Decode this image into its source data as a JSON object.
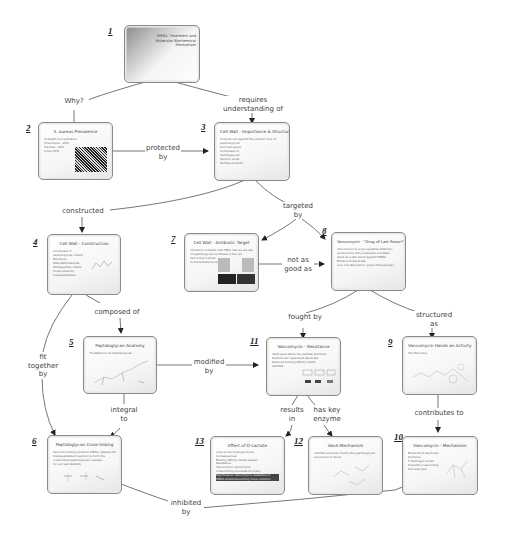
{
  "diagram": {
    "type": "concept-map",
    "nodes": [
      {
        "id": 1,
        "num": "1",
        "title": "MRSA: Treatment and Molecular Biochemical Mechanism",
        "body": [
          "",
          ""
        ]
      },
      {
        "id": 2,
        "num": "2",
        "title": "S. aureus Prevalence",
        "body": [
          "% Death Concentration of Population",
          "Pneumonia - 20%",
          "Trachea - 40%",
          "Colon 25%"
        ]
      },
      {
        "id": 3,
        "num": "3",
        "title": "Cell Wall - Importance & Structure",
        "body": [
          "Protects cell against the osmotic flow of",
          "peptidoglycan",
          "Cell wall layers",
          "Composed of:",
          "Peptidoglycan",
          "Teichoic acids",
          "Surface proteins"
        ]
      },
      {
        "id": 4,
        "num": "4",
        "title": "Cell Wall - Construction",
        "body": [
          "Composed of",
          "peptidoglycan chains",
          "Backbone",
          "NAG-NAM subunits",
          "Pentapeptide chains",
          "Cross-linked by",
          "transpeptidases"
        ]
      },
      {
        "id": 5,
        "num": "5",
        "title": "Peptidoglycan Anatomy",
        "body": [
          "The Basis for all Peptidoglycan"
        ]
      },
      {
        "id": 6,
        "num": "6",
        "title": "Peptidoglycan Cross-linking",
        "body": [
          "Penicillin binding proteins (PBPs) catalyze the",
          "transpeptidation reaction to form the",
          "cross-linked peptidoglycan needed",
          "for cell wall stability"
        ]
      },
      {
        "id": 7,
        "num": "7",
        "title": "Cell Wall - Antibiotic Target",
        "body": [
          "Inhibitors compete with PBPs, but we are aware",
          "of peptidoglycan synthesis in the cell",
          "Vancomycin binds",
          "to D-Ala-D-Ala termini"
        ]
      },
      {
        "id": 8,
        "num": "8",
        "title": "Vancomycin - \"Drug of Last Resort\"",
        "body": [
          "Vancomycin is a glycopeptide antibiotic",
          "produced by Amycolatopsis orientalis",
          "Used as a last resort against MRSA",
          "Binds to D-Ala-D-Ala",
          "Low oral absorption; given intravenously"
        ]
      },
      {
        "id": 9,
        "num": "9",
        "title": "Vancomycin Hands an Activity",
        "body": [
          "The Structure"
        ]
      },
      {
        "id": 10,
        "num": "10",
        "title": "Vancomycin - Mechanism",
        "body": [
          "Binds the D-Ala-D-Ala",
          "terminus",
          "5 Hydrogen bonds",
          "Prevents cross-linking",
          "Cell wall lysis"
        ]
      },
      {
        "id": 11,
        "num": "11",
        "title": "Vancomycin - Resistance",
        "body": [
          "VanA gene alters the peptide terminus",
          "D-Ala-D-Lac replaces D-Ala-D-Ala",
          "Reduced binding affinity 1000x",
          "VanHAX"
        ]
      },
      {
        "id": 12,
        "num": "12",
        "title": "VanA Mechanism",
        "body": [
          "VanHAX enzymes modify the peptidoglycan",
          "precursors to D-Lac"
        ]
      },
      {
        "id": 13,
        "num": "13",
        "title": "Effect of D-Lactate",
        "body": [
          "Loss of one hydrogen bond",
          "Consequences",
          "Binding affinity 1000x weaker",
          "Resistance",
          "Vancomycin cannot bind",
          "cross-linking proceeds normally",
          "Significance: Vancomycin resistance in",
          "MRSA strains becoming more common"
        ]
      }
    ],
    "edges": [
      {
        "from": 1,
        "to": 2,
        "label": "Why?"
      },
      {
        "from": 1,
        "to": 3,
        "label": "requires understanding of"
      },
      {
        "from": 2,
        "to": 3,
        "label": "protected by"
      },
      {
        "from": 3,
        "to": 4,
        "label": "constructed"
      },
      {
        "from": 3,
        "to": 7,
        "label": "targeted by"
      },
      {
        "from": 3,
        "to": 8,
        "label": "targeted by"
      },
      {
        "from": 7,
        "to": 8,
        "label": "not as good as"
      },
      {
        "from": 4,
        "to": 5,
        "label": "composed of"
      },
      {
        "from": 4,
        "to": 6,
        "label": "fit together by"
      },
      {
        "from": 5,
        "to": 6,
        "label": "integral to"
      },
      {
        "from": 5,
        "to": 11,
        "label": "modified by"
      },
      {
        "from": 8,
        "to": 11,
        "label": "fought by"
      },
      {
        "from": 8,
        "to": 9,
        "label": "structured as"
      },
      {
        "from": 9,
        "to": 10,
        "label": "contributes to"
      },
      {
        "from": 11,
        "to": 13,
        "label": "results in"
      },
      {
        "from": 11,
        "to": 12,
        "label": "has key enzyme"
      },
      {
        "from": 6,
        "to": 10,
        "label": "inhibited by"
      }
    ]
  },
  "labels": {
    "why": "Why?",
    "requires_1": "requires",
    "requires_2": "understanding of",
    "protected_1": "protected",
    "protected_2": "by",
    "constructed": "constructed",
    "targeted_1": "targeted",
    "targeted_2": "by",
    "notasgood_1": "not as",
    "notasgood_2": "good as",
    "composed": "composed of",
    "fit_1": "fit",
    "fit_2": "together",
    "fit_3": "by",
    "integral_1": "integral",
    "integral_2": "to",
    "modified_1": "modified",
    "modified_2": "by",
    "fought": "fought by",
    "structured_1": "structured",
    "structured_2": "as",
    "contributes": "contributes to",
    "results_1": "results",
    "results_2": "in",
    "haskey_1": "has key",
    "haskey_2": "enzyme",
    "inhibited_1": "inhibited",
    "inhibited_2": "by"
  },
  "colors": {
    "edge": "#555555",
    "border": "#8a8a8a",
    "background": "#ffffff"
  }
}
